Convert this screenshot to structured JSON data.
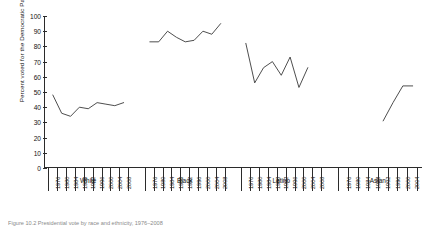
{
  "figure": {
    "caption": "Figure 10.2  Presidential vote by race and ethnicity, 1976–2008"
  },
  "axes": {
    "ylabel": "Percent voted for the Democratic Party",
    "yticks": [
      "0",
      "10",
      "20",
      "30",
      "40",
      "50",
      "60",
      "70",
      "80",
      "90",
      "100"
    ]
  },
  "groups": [
    {
      "name": "White"
    },
    {
      "name": "Black"
    },
    {
      "name": "Latino"
    },
    {
      "name": "Asian"
    }
  ],
  "chart_data": {
    "type": "line",
    "title": "",
    "xlabel": "",
    "ylabel": "Percent voted for the Democratic Party",
    "ylim": [
      0,
      100
    ],
    "ytick_step": 10,
    "grid": false,
    "legend": "none",
    "panels": [
      {
        "name": "White",
        "x": [
          "1976",
          "1980",
          "1984",
          "1988",
          "1992",
          "1996",
          "2000",
          "2004",
          "2008"
        ],
        "values": [
          48,
          36,
          34,
          40,
          39,
          43,
          42,
          41,
          43
        ]
      },
      {
        "name": "Black",
        "x": [
          "1976",
          "1980",
          "1984",
          "1988",
          "1992",
          "1996",
          "2000",
          "2004",
          "2008"
        ],
        "values": [
          83,
          83,
          90,
          86,
          83,
          84,
          90,
          88,
          95
        ]
      },
      {
        "name": "Latino",
        "x": [
          "1976",
          "1980",
          "1984",
          "1988",
          "1992",
          "1996",
          "2000",
          "2004",
          "2008"
        ],
        "values": [
          82,
          56,
          66,
          70,
          61,
          73,
          53,
          66,
          null
        ]
      },
      {
        "name": "Asian",
        "x": [
          "1976",
          "1980",
          "1984",
          "1988",
          "1992",
          "1996",
          "2000",
          "2004"
        ],
        "values": [
          null,
          null,
          null,
          null,
          31,
          43,
          54,
          54
        ]
      }
    ]
  }
}
